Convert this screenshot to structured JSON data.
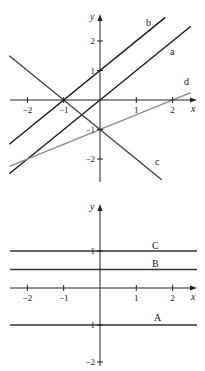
{
  "chart_data": [
    {
      "type": "line",
      "title": "",
      "xlabel": "x",
      "ylabel": "y",
      "xlim": [
        -2.5,
        2.5
      ],
      "ylim": [
        -2.6,
        2.6
      ],
      "x_ticks": [
        -2,
        -1,
        1,
        2
      ],
      "x_tick_labels": [
        "−2",
        "−1",
        "1",
        "2"
      ],
      "y_ticks": [
        2,
        1,
        -1,
        -2
      ],
      "y_tick_labels": [
        "2",
        "1",
        "−1",
        "−2"
      ],
      "grid": false,
      "series": [
        {
          "name": "b",
          "equation": "y = x + 1",
          "slope": 1,
          "intercept": 1,
          "x_range": [
            -2.5,
            1.8
          ],
          "color": "#1a1a1a"
        },
        {
          "name": "a",
          "equation": "y = x",
          "slope": 1,
          "intercept": 0,
          "x_range": [
            -2.5,
            2.5
          ],
          "color": "#1a1a1a"
        },
        {
          "name": "c",
          "equation": "y = -x - 1",
          "slope": -1,
          "intercept": -1,
          "x_range": [
            -2.5,
            1.7
          ],
          "color": "#444444"
        },
        {
          "name": "d",
          "equation": "y = x/2 - 1",
          "slope": 0.5,
          "intercept": -1,
          "x_range": [
            -2.5,
            2.5
          ],
          "color": "#8a8a8a"
        }
      ]
    },
    {
      "type": "line",
      "title": "",
      "xlabel": "x",
      "ylabel": "y",
      "xlim": [
        -2.5,
        2.5
      ],
      "ylim": [
        -2.1,
        2.3
      ],
      "x_ticks": [
        -2,
        -1,
        1,
        2
      ],
      "x_tick_labels": [
        "−2",
        "−1",
        "1",
        "2"
      ],
      "y_ticks": [
        1,
        -1,
        -2
      ],
      "y_tick_labels": [
        "1",
        "1",
        "−2"
      ],
      "grid": false,
      "series": [
        {
          "name": "C",
          "equation": "y = 1",
          "slope": 0,
          "intercept": 1,
          "x_range": [
            -2.5,
            2.7
          ],
          "color": "#333333"
        },
        {
          "name": "B",
          "equation": "y = 0.5",
          "slope": 0,
          "intercept": 0.5,
          "x_range": [
            -2.5,
            2.7
          ],
          "color": "#333333"
        },
        {
          "name": "A",
          "equation": "y = -1",
          "slope": 0,
          "intercept": -1,
          "x_range": [
            -2.5,
            2.7
          ],
          "color": "#333333"
        }
      ]
    }
  ]
}
